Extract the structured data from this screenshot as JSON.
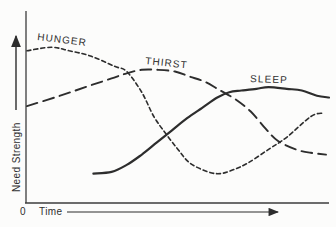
{
  "chart_data": {
    "type": "line",
    "xlabel": "Time",
    "ylabel": "Need Strength",
    "origin_label": "0",
    "x_range": [
      0,
      100
    ],
    "y_range": [
      0,
      100
    ],
    "grid": false,
    "legend_position": "inline-curve-labels",
    "axes_note": "qualitative sketch; axes have direction arrows but no tick marks or numeric scales",
    "ink_color": "#2d2d2d",
    "series": [
      {
        "name": "HUNGER",
        "line_style": "short-dash",
        "color": "#2d2d2d",
        "points": [
          [
            0,
            88
          ],
          [
            8,
            90
          ],
          [
            14,
            88
          ],
          [
            21,
            85
          ],
          [
            29,
            79
          ],
          [
            33,
            76
          ],
          [
            38,
            64
          ],
          [
            42,
            50
          ],
          [
            46,
            40
          ],
          [
            50,
            31
          ],
          [
            54,
            23
          ],
          [
            60,
            18
          ],
          [
            64,
            17
          ],
          [
            68,
            19
          ],
          [
            73,
            23
          ],
          [
            80,
            31
          ],
          [
            86,
            38
          ],
          [
            94,
            50
          ],
          [
            98,
            52
          ]
        ]
      },
      {
        "name": "THIRST",
        "line_style": "long-dash",
        "color": "#2d2d2d",
        "points": [
          [
            0,
            56
          ],
          [
            11,
            62
          ],
          [
            21,
            68
          ],
          [
            28,
            72
          ],
          [
            33,
            75
          ],
          [
            38,
            77
          ],
          [
            43,
            77
          ],
          [
            49,
            76
          ],
          [
            54,
            73
          ],
          [
            59,
            70
          ],
          [
            64,
            65
          ],
          [
            69,
            60
          ],
          [
            74,
            53
          ],
          [
            79,
            43
          ],
          [
            83,
            36
          ],
          [
            89,
            31
          ],
          [
            94,
            29
          ],
          [
            99,
            28
          ]
        ]
      },
      {
        "name": "SLEEP",
        "line_style": "solid",
        "color": "#2d2d2d",
        "points": [
          [
            22,
            17
          ],
          [
            28,
            18
          ],
          [
            33,
            22
          ],
          [
            38,
            28
          ],
          [
            43,
            35
          ],
          [
            48,
            42
          ],
          [
            53,
            49
          ],
          [
            58,
            55
          ],
          [
            63,
            61
          ],
          [
            67,
            64
          ],
          [
            71,
            65
          ],
          [
            76,
            66
          ],
          [
            80,
            67
          ],
          [
            86,
            66
          ],
          [
            91,
            65
          ],
          [
            96,
            62
          ],
          [
            100,
            61
          ]
        ]
      }
    ]
  }
}
